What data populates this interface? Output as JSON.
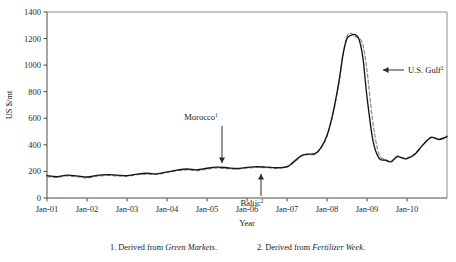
{
  "chart_data": {
    "type": "line",
    "title": "",
    "xlabel": "Year",
    "ylabel": "US $/mt",
    "ylim": [
      0,
      1400
    ],
    "ytick_values": [
      0,
      200,
      400,
      600,
      800,
      1000,
      1200,
      1400
    ],
    "ytick_labels": [
      "0",
      "200",
      "400",
      "600",
      "800",
      "1000",
      "1200",
      "1400"
    ],
    "xtick_labels": [
      "Jan-01",
      "Jan-02",
      "Jan-03",
      "Jan-04",
      "Jan-05",
      "Jan-06",
      "Jan-07",
      "Jan-08",
      "Jan-09",
      "Jan-10"
    ],
    "xtick_positions": [
      2001,
      2002,
      2003,
      2004,
      2005,
      2006,
      2007,
      2008,
      2009,
      2010
    ],
    "xlim": [
      2001,
      2011
    ],
    "grid": false,
    "legend_position": "none",
    "series": [
      {
        "name": "Morocco",
        "style": "solid",
        "color": "#141414",
        "x": [
          2001.0,
          2001.25,
          2001.5,
          2001.75,
          2002.0,
          2002.25,
          2002.5,
          2002.75,
          2003.0,
          2003.25,
          2003.5,
          2003.75,
          2004.0,
          2004.25,
          2004.5,
          2004.75,
          2005.0,
          2005.25,
          2005.5,
          2005.75,
          2006.0,
          2006.25,
          2006.5,
          2006.75,
          2007.0,
          2007.15,
          2007.35,
          2007.5,
          2007.7,
          2007.85,
          2008.0,
          2008.15,
          2008.3,
          2008.4,
          2008.5,
          2008.6,
          2008.7,
          2008.8,
          2008.9,
          2009.0,
          2009.15,
          2009.3,
          2009.45,
          2009.6,
          2009.75,
          2009.9,
          2010.0,
          2010.2,
          2010.4,
          2010.6,
          2010.8,
          2011.0
        ],
        "values": [
          168,
          160,
          172,
          166,
          158,
          170,
          176,
          172,
          168,
          180,
          186,
          182,
          196,
          210,
          218,
          212,
          224,
          232,
          228,
          222,
          230,
          236,
          232,
          228,
          236,
          268,
          318,
          330,
          334,
          380,
          470,
          640,
          880,
          1080,
          1200,
          1225,
          1230,
          1195,
          1050,
          760,
          430,
          300,
          285,
          272,
          310,
          300,
          296,
          330,
          400,
          455,
          440,
          462
        ]
      },
      {
        "name": "U.S. Gulf / Baltic",
        "style": "dashed",
        "color": "#8d8d8d",
        "x": [
          2001.0,
          2001.25,
          2001.5,
          2001.75,
          2002.0,
          2002.25,
          2002.5,
          2002.75,
          2003.0,
          2003.25,
          2003.5,
          2003.75,
          2004.0,
          2004.25,
          2004.5,
          2004.75,
          2005.0,
          2005.25,
          2005.5,
          2005.75,
          2006.0,
          2006.25,
          2006.5,
          2006.75,
          2007.0,
          2007.15,
          2007.35,
          2007.5,
          2007.7,
          2007.85,
          2008.0,
          2008.15,
          2008.3,
          2008.4,
          2008.5,
          2008.6,
          2008.7,
          2008.8,
          2008.9,
          2009.0,
          2009.15,
          2009.3,
          2009.45,
          2009.6,
          2009.75,
          2009.9,
          2010.0,
          2010.2,
          2010.4,
          2010.6,
          2010.8,
          2011.0
        ],
        "values": [
          160,
          155,
          166,
          160,
          152,
          164,
          170,
          166,
          164,
          176,
          180,
          178,
          192,
          206,
          212,
          206,
          218,
          226,
          222,
          218,
          226,
          230,
          228,
          224,
          232,
          262,
          312,
          326,
          330,
          376,
          466,
          630,
          870,
          1075,
          1215,
          1240,
          1215,
          1205,
          1150,
          960,
          560,
          330,
          292,
          278,
          316,
          302,
          300,
          335,
          404,
          458,
          444,
          468
        ]
      }
    ],
    "annotations": [
      {
        "name": "morocco-annotation",
        "label": "Morocco",
        "superscript": "1",
        "text_x": 201,
        "text_y": 120,
        "arrow_from_x": 222,
        "arrow_from_y": 126,
        "arrow_to_x": 222,
        "arrow_to_y": 163,
        "direction": "down"
      },
      {
        "name": "baltic-annotation",
        "label": "Baltic",
        "superscript": "2",
        "text_x": 252,
        "text_y": 206,
        "arrow_from_x": 261,
        "arrow_from_y": 196,
        "arrow_to_x": 261,
        "arrow_to_y": 174,
        "direction": "up"
      },
      {
        "name": "us-gulf-annotation",
        "label": "U.S. Gulf",
        "superscript": "2",
        "text_x": 408,
        "text_y": 73,
        "arrow_from_x": 404,
        "arrow_from_y": 70,
        "arrow_to_x": 383,
        "arrow_to_y": 70,
        "direction": "left"
      }
    ]
  },
  "footnotes": [
    {
      "number": "1. Derived from ",
      "source": "Green Markets",
      "terminator": "."
    },
    {
      "number": "2. Derived from ",
      "source": "Fertilizer Week",
      "terminator": "."
    }
  ]
}
